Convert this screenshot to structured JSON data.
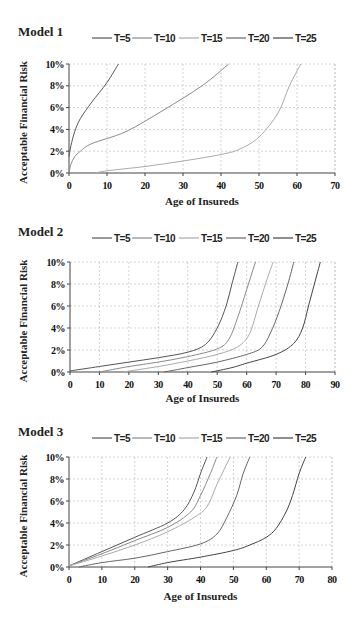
{
  "colors": {
    "T5": "#555555",
    "T10": "#8a8a8a",
    "T15": "#aaaaaa",
    "T20": "#666666",
    "T25": "#444444",
    "grid": "#c8c8c8",
    "axis": "#444444"
  },
  "chart_data": [
    {
      "type": "line",
      "title": "Model 1",
      "xlabel": "Age of Insureds",
      "ylabel": "Acceptable Financial Risk",
      "xlim": [
        0,
        70
      ],
      "ylim": [
        0,
        10
      ],
      "x_ticks": [
        "0",
        "10",
        "20",
        "30",
        "40",
        "50",
        "60",
        "70"
      ],
      "y_ticks": [
        "0%",
        "2%",
        "4%",
        "6%",
        "8%",
        "10%"
      ],
      "grid": true,
      "legend_position": "top",
      "legend": [
        "T=5",
        "T=10",
        "T=15",
        "T=20",
        "T=25"
      ],
      "series": [
        {
          "name": "T=5",
          "points": [
            [
              0,
              1.5
            ],
            [
              0.5,
              2.5
            ],
            [
              1.5,
              3.8
            ],
            [
              3,
              5
            ],
            [
              6,
              6.5
            ],
            [
              10,
              8.3
            ],
            [
              13,
              10
            ]
          ]
        },
        {
          "name": "T=10",
          "points": [
            [
              0,
              0
            ],
            [
              0.5,
              0.8
            ],
            [
              1.5,
              1.5
            ],
            [
              3,
              2
            ],
            [
              6,
              2.7
            ],
            [
              15,
              3.8
            ],
            [
              25,
              5.8
            ],
            [
              35,
              8
            ],
            [
              42,
              10
            ]
          ]
        },
        {
          "name": "T=15",
          "points": [
            [
              7,
              0
            ],
            [
              10,
              0.2
            ],
            [
              20,
              0.6
            ],
            [
              30,
              1.1
            ],
            [
              40,
              1.7
            ],
            [
              45,
              2.2
            ],
            [
              50,
              3.3
            ],
            [
              55,
              5.5
            ],
            [
              58,
              8
            ],
            [
              61,
              10
            ]
          ]
        }
      ]
    },
    {
      "type": "line",
      "title": "Model 2",
      "xlabel": "Age of Insureds",
      "ylabel": "Acceptable Financial Risk",
      "xlim": [
        0,
        90
      ],
      "ylim": [
        0,
        10
      ],
      "x_ticks": [
        "0",
        "10",
        "20",
        "30",
        "40",
        "50",
        "60",
        "70",
        "80",
        "90"
      ],
      "y_ticks": [
        "0%",
        "2%",
        "4%",
        "6%",
        "8%",
        "10%"
      ],
      "grid": true,
      "legend_position": "top",
      "legend": [
        "T=5",
        "T=10",
        "T=15",
        "T=20",
        "T=25"
      ],
      "series": [
        {
          "name": "T=5",
          "points": [
            [
              0,
              0.1
            ],
            [
              10,
              0.5
            ],
            [
              20,
              0.9
            ],
            [
              30,
              1.3
            ],
            [
              40,
              1.8
            ],
            [
              46,
              2.5
            ],
            [
              50,
              4
            ],
            [
              53,
              6
            ],
            [
              55,
              8
            ],
            [
              57,
              10
            ]
          ]
        },
        {
          "name": "T=10",
          "points": [
            [
              10,
              0
            ],
            [
              20,
              0.5
            ],
            [
              30,
              0.9
            ],
            [
              40,
              1.4
            ],
            [
              50,
              2.1
            ],
            [
              54,
              3
            ],
            [
              57,
              5
            ],
            [
              60,
              7.5
            ],
            [
              63,
              10
            ]
          ]
        },
        {
          "name": "T=15",
          "points": [
            [
              18,
              0
            ],
            [
              30,
              0.5
            ],
            [
              40,
              1
            ],
            [
              50,
              1.6
            ],
            [
              57,
              2.3
            ],
            [
              61,
              3.5
            ],
            [
              64,
              6
            ],
            [
              67,
              8.5
            ],
            [
              69,
              10
            ]
          ]
        },
        {
          "name": "T=20",
          "points": [
            [
              32,
              0
            ],
            [
              40,
              0.4
            ],
            [
              50,
              0.9
            ],
            [
              60,
              1.6
            ],
            [
              65,
              2.2
            ],
            [
              68,
              3.5
            ],
            [
              71,
              5.5
            ],
            [
              74,
              8
            ],
            [
              76,
              10
            ]
          ]
        },
        {
          "name": "T=25",
          "points": [
            [
              48,
              0
            ],
            [
              55,
              0.4
            ],
            [
              60,
              0.8
            ],
            [
              70,
              1.6
            ],
            [
              76,
              2.6
            ],
            [
              79,
              4
            ],
            [
              81,
              6
            ],
            [
              83,
              8
            ],
            [
              85,
              10
            ]
          ]
        }
      ]
    },
    {
      "type": "line",
      "title": "Model 3",
      "xlabel": "Age of Insureds",
      "ylabel": "Acceptable Financial Risk",
      "xlim": [
        0,
        80
      ],
      "ylim": [
        0,
        10
      ],
      "x_ticks": [
        "0",
        "10",
        "20",
        "30",
        "40",
        "50",
        "60",
        "70",
        "80"
      ],
      "y_ticks": [
        "0%",
        "2%",
        "4%",
        "6%",
        "8%",
        "10%"
      ],
      "grid": true,
      "legend_position": "top",
      "legend": [
        "T=5",
        "T=10",
        "T=15",
        "T=20",
        "T=25"
      ],
      "series": [
        {
          "name": "T=5",
          "points": [
            [
              0,
              0.1
            ],
            [
              10,
              1.4
            ],
            [
              20,
              2.7
            ],
            [
              30,
              4
            ],
            [
              35,
              5.2
            ],
            [
              38,
              6.8
            ],
            [
              40,
              8.5
            ],
            [
              42,
              10
            ]
          ]
        },
        {
          "name": "T=10",
          "points": [
            [
              0,
              0.1
            ],
            [
              10,
              1.2
            ],
            [
              20,
              2.4
            ],
            [
              30,
              3.6
            ],
            [
              37,
              5
            ],
            [
              40,
              6.5
            ],
            [
              43,
              8.5
            ],
            [
              45,
              10
            ]
          ]
        },
        {
          "name": "T=15",
          "points": [
            [
              0,
              0.1
            ],
            [
              10,
              1
            ],
            [
              20,
              2
            ],
            [
              30,
              3.2
            ],
            [
              38,
              4.5
            ],
            [
              42,
              5.5
            ],
            [
              45,
              7.5
            ],
            [
              49,
              10
            ]
          ]
        },
        {
          "name": "T=20",
          "points": [
            [
              3,
              0
            ],
            [
              10,
              0.4
            ],
            [
              20,
              0.8
            ],
            [
              30,
              1.4
            ],
            [
              40,
              2.1
            ],
            [
              45,
              3
            ],
            [
              48,
              4.5
            ],
            [
              51,
              6.5
            ],
            [
              53,
              8.5
            ],
            [
              55,
              10
            ]
          ]
        },
        {
          "name": "T=25",
          "points": [
            [
              24,
              0
            ],
            [
              30,
              0.4
            ],
            [
              40,
              0.9
            ],
            [
              50,
              1.5
            ],
            [
              55,
              2
            ],
            [
              60,
              2.7
            ],
            [
              63,
              3.5
            ],
            [
              66,
              5
            ],
            [
              68,
              6.5
            ],
            [
              70,
              8.5
            ],
            [
              72,
              10
            ]
          ]
        }
      ]
    }
  ]
}
